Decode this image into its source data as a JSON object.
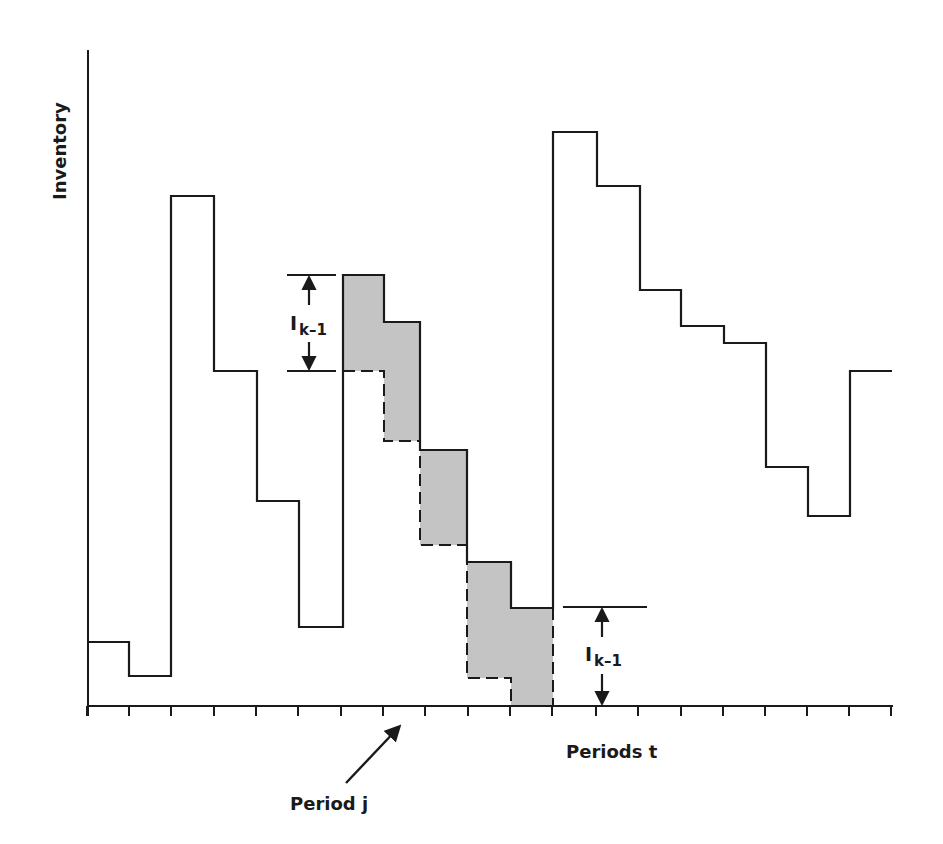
{
  "chart_data": {
    "type": "step",
    "title": "",
    "ylabel": "Inventory",
    "xlabel": "Periods t",
    "grid": false,
    "n_periods": 19,
    "x_ticks_px": [
      87,
      129,
      171,
      214,
      256,
      298,
      341,
      383,
      425,
      468,
      510,
      552,
      596,
      638,
      681,
      723,
      765,
      807,
      849,
      891
    ],
    "axis": {
      "origin_x": 88,
      "origin_y": 706,
      "top_y": 50,
      "end_x": 893
    },
    "inventory_profile": {
      "description": "Solid step line; y in pixel coords (smaller = higher inventory)",
      "periods": [
        {
          "x0": 88,
          "x1": 129,
          "y": 642
        },
        {
          "x0": 129,
          "x1": 171,
          "y": 676
        },
        {
          "x0": 171,
          "x1": 214,
          "y": 196
        },
        {
          "x0": 214,
          "x1": 257,
          "y": 371
        },
        {
          "x0": 257,
          "x1": 299,
          "y": 501
        },
        {
          "x0": 299,
          "x1": 343,
          "y": 627
        },
        {
          "x0": 343,
          "x1": 384,
          "y": 275
        },
        {
          "x0": 384,
          "x1": 420,
          "y": 322
        },
        {
          "x0": 420,
          "x1": 467,
          "y": 450
        },
        {
          "x0": 467,
          "x1": 511,
          "y": 562
        },
        {
          "x0": 511,
          "x1": 553,
          "y": 608
        },
        {
          "x0": 553,
          "x1": 597,
          "y": 132
        },
        {
          "x0": 597,
          "x1": 640,
          "y": 186
        },
        {
          "x0": 640,
          "x1": 681,
          "y": 290
        },
        {
          "x0": 681,
          "x1": 724,
          "y": 326
        },
        {
          "x0": 724,
          "x1": 766,
          "y": 343
        },
        {
          "x0": 766,
          "x1": 808,
          "y": 467
        },
        {
          "x0": 808,
          "x1": 850,
          "y": 516
        },
        {
          "x0": 850,
          "x1": 892,
          "y": 371
        }
      ]
    },
    "shaded_region": {
      "description": "Gray band of height I_{k-1} between solid profile and dashed lower profile, periods 7-11",
      "fill": "#c4c4c4",
      "upper": [
        {
          "x0": 343,
          "x1": 384,
          "y": 275
        },
        {
          "x0": 384,
          "x1": 420,
          "y": 322
        },
        {
          "x0": 420,
          "x1": 467,
          "y": 450
        },
        {
          "x0": 467,
          "x1": 511,
          "y": 562
        },
        {
          "x0": 511,
          "x1": 553,
          "y": 608
        }
      ],
      "lower_dashed": [
        {
          "x0": 343,
          "x1": 384,
          "y": 371
        },
        {
          "x0": 384,
          "x1": 420,
          "y": 441
        },
        {
          "x0": 420,
          "x1": 467,
          "y": 545
        },
        {
          "x0": 467,
          "x1": 511,
          "y": 678
        },
        {
          "x0": 511,
          "x1": 553,
          "y": 706
        }
      ]
    },
    "annotations": [
      {
        "text": "I",
        "subscript": "k–1",
        "kind": "bracket",
        "x": 309,
        "y_top": 275,
        "y_bottom": 371,
        "line_x0": 287,
        "line_x1": 336
      },
      {
        "text": "I",
        "subscript": "k–1",
        "kind": "bracket",
        "x": 602,
        "y_top": 607,
        "y_bottom": 706,
        "line_x0": 563,
        "line_x1": 647
      },
      {
        "text": "Period j",
        "kind": "arrow",
        "from": [
          346,
          783
        ],
        "to": [
          401,
          724
        ]
      }
    ]
  },
  "labels": {
    "y_axis": "Inventory",
    "x_axis": "Periods t",
    "period_j": "Period j",
    "ik_main": "I",
    "ik_sub": "k–1"
  },
  "colors": {
    "line": "#1a1a1a",
    "fill": "#c4c4c4",
    "background": "#ffffff"
  }
}
